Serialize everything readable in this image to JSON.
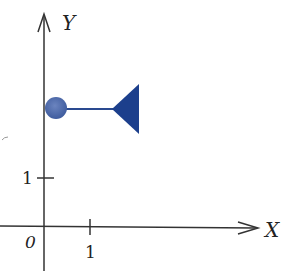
{
  "axes": {
    "x_label": "X",
    "y_label": "Y",
    "origin_label": "0",
    "x_tick_label": "1",
    "y_tick_label": "1",
    "axis_color": "#333333"
  },
  "shapes": {
    "circle": {
      "cx_units": 0.25,
      "cy_units": 2.6,
      "color": "#4a67a8"
    },
    "connector": {
      "color": "#2a4a90"
    },
    "triangle": {
      "color": "#1c3f8c"
    }
  }
}
